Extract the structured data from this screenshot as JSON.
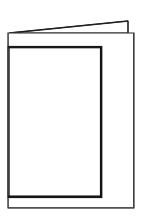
{
  "image": {
    "kind": "line-art-illustration",
    "subject": "folded greeting card standing open",
    "alt_text": "Black outline drawing of a blank folded greeting card viewed at an angle, standing open",
    "width": 146,
    "height": 219,
    "background_color": "#ffffff"
  },
  "style": {
    "stroke_color_dark": "#1a1a1a",
    "stroke_color_mid": "#3c3c3c",
    "stroke_color_light": "#555555",
    "fill_color": "#ffffff",
    "thin_stroke_width": 1.1,
    "thick_stroke_width": 2.2
  },
  "shapes": {
    "back_flap": {
      "label": "back flap wedge",
      "points": "9,33 128,21 128,33"
    },
    "back_flap_spine": {
      "label": "back flap right spine",
      "x1": 128,
      "y1": 21,
      "x2": 128,
      "y2": 33
    },
    "outer_panel": {
      "label": "open card body panel",
      "x": 8,
      "y": 33,
      "width": 126,
      "height": 175
    },
    "inner_panel": {
      "label": "front cover panel",
      "x": 8,
      "y": 47,
      "width": 93,
      "height": 150
    },
    "fold_line": {
      "label": "center fold crease",
      "x1": 101,
      "y1": 47,
      "x2": 101,
      "y2": 197
    }
  }
}
